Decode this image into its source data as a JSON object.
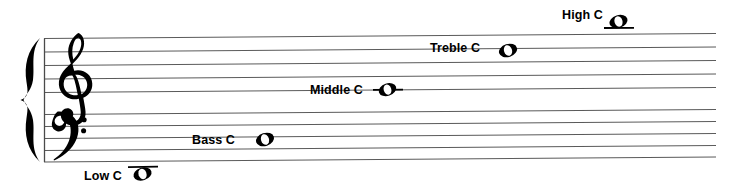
{
  "diagram": {
    "background_color": "#ffffff",
    "ink_color": "#000000",
    "staff_line_color": "#5a5a5a",
    "width": 747,
    "height": 186
  },
  "clefs": [
    {
      "name": "treble-clef",
      "symbol": "𝄞",
      "staff": "treble"
    },
    {
      "name": "bass-clef",
      "symbol": "𝄢",
      "staff": "bass"
    }
  ],
  "brace": {
    "name": "grand-staff-brace",
    "symbol": "{"
  },
  "staves": [
    {
      "name": "treble-staff",
      "lines": 5
    },
    {
      "name": "bass-staff",
      "lines": 5
    }
  ],
  "notes": [
    {
      "id": "high-c",
      "label": "High C",
      "note_head": "whole-note",
      "ledger_line": true,
      "ledger_position": "below-note",
      "position": "above treble staff"
    },
    {
      "id": "treble-c",
      "label": "Treble C",
      "note_head": "whole-note",
      "ledger_line": false,
      "ledger_position": "none",
      "position": "third space of treble staff"
    },
    {
      "id": "middle-c",
      "label": "Middle C",
      "note_head": "whole-note",
      "ledger_line": true,
      "ledger_position": "through-note",
      "position": "between treble and bass staves"
    },
    {
      "id": "bass-c",
      "label": "Bass C",
      "note_head": "whole-note",
      "ledger_line": false,
      "ledger_position": "none",
      "position": "second space of bass staff"
    },
    {
      "id": "low-c",
      "label": "Low C",
      "note_head": "whole-note",
      "ledger_line": true,
      "ledger_position": "above-note",
      "position": "below bass staff"
    }
  ]
}
